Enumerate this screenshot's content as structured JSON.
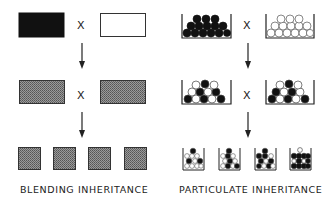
{
  "blending": {
    "label": "BLENDING INHERITANCE",
    "cross_symbol_1": "X",
    "cross_symbol_2": "X",
    "parents": [
      "black-rectangle",
      "white-rectangle"
    ],
    "f1": [
      "grey-rectangle",
      "grey-rectangle"
    ],
    "f2": [
      "grey-square",
      "grey-square",
      "grey-square",
      "grey-square"
    ]
  },
  "particulate": {
    "label": "PARTICULATE INHERITANCE",
    "cross_symbol_1": "X",
    "cross_symbol_2": "X",
    "parents": [
      "beaker-all-black-balls",
      "beaker-all-white-balls"
    ],
    "f1": [
      "beaker-mixed-balls",
      "beaker-mixed-balls"
    ],
    "f2": [
      "beaker-mostly-white",
      "beaker-mixed",
      "beaker-mixed-dark",
      "beaker-mostly-black"
    ]
  },
  "colors": {
    "black": "#111111",
    "grey": "#8a8a8a",
    "line": "#222222"
  }
}
